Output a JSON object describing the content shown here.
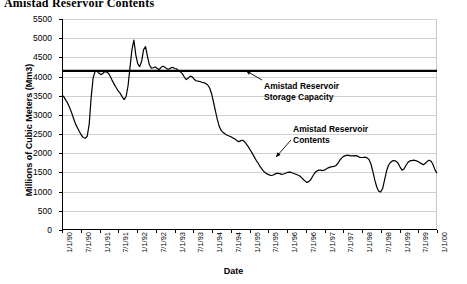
{
  "chart_data": {
    "type": "line",
    "title": "Amistad Reservoir Contents",
    "xlabel": "Date",
    "ylabel": "Millions of Cubic Meters (Mm3)",
    "ylim": [
      0,
      5500
    ],
    "ytick_step": 500,
    "yticks": [
      0,
      500,
      1000,
      1500,
      2000,
      2500,
      3000,
      3500,
      4000,
      4500,
      5000,
      5500
    ],
    "grid": true,
    "legend": "none",
    "xtick_labels": [
      "1/1/90",
      "7/1/90",
      "1/1/91",
      "7/1/91",
      "1/1/92",
      "7/1/92",
      "1/1/93",
      "7/1/93",
      "1/1/94",
      "7/1/94",
      "1/1/95",
      "7/1/95",
      "1/1/96",
      "7/1/96",
      "1/1/97",
      "7/1/97",
      "1/1/98",
      "7/1/98",
      "1/1/99",
      "7/1/99",
      "1/1/00"
    ],
    "x_start": "1/1/90",
    "x_end": "1/1/00",
    "x_tick_interval_months": 6,
    "annotations": [
      {
        "name": "capacity-annotation",
        "text_line1": "Amistad Reservoir",
        "text_line2": "Storage Capacity",
        "points_to_value": 4150
      },
      {
        "name": "contents-annotation",
        "text_line1": "Amistad Reservoir",
        "text_line2": "Contents",
        "points_to_value": 1500
      }
    ],
    "series": [
      {
        "name": "Amistad Reservoir Storage Capacity",
        "color": "#000000",
        "width": 2.2,
        "constant_value": 4150,
        "values": [
          4150,
          4150
        ]
      },
      {
        "name": "Amistad Reservoir Contents",
        "color": "#000000",
        "width": 1.2,
        "values": [
          3520,
          3470,
          3380,
          3300,
          3180,
          3050,
          2900,
          2760,
          2660,
          2560,
          2470,
          2410,
          2390,
          2450,
          2760,
          3450,
          3960,
          4130,
          4140,
          4090,
          4050,
          4080,
          4130,
          4120,
          4080,
          3990,
          3880,
          3790,
          3700,
          3620,
          3560,
          3470,
          3400,
          3480,
          3760,
          4240,
          4700,
          4950,
          4560,
          4330,
          4260,
          4400,
          4700,
          4780,
          4520,
          4300,
          4220,
          4230,
          4250,
          4210,
          4180,
          4240,
          4270,
          4240,
          4200,
          4190,
          4230,
          4240,
          4210,
          4200,
          4160,
          4120,
          4070,
          3980,
          3920,
          3960,
          4010,
          3990,
          3930,
          3890,
          3880,
          3870,
          3850,
          3840,
          3820,
          3780,
          3700,
          3550,
          3330,
          3090,
          2870,
          2690,
          2590,
          2540,
          2500,
          2470,
          2450,
          2430,
          2400,
          2370,
          2330,
          2300,
          2330,
          2340,
          2300,
          2230,
          2160,
          2080,
          1990,
          1900,
          1810,
          1740,
          1650,
          1580,
          1520,
          1480,
          1450,
          1430,
          1420,
          1440,
          1470,
          1480,
          1470,
          1450,
          1460,
          1480,
          1500,
          1510,
          1500,
          1480,
          1460,
          1440,
          1420,
          1380,
          1330,
          1280,
          1240,
          1260,
          1310,
          1400,
          1480,
          1530,
          1560,
          1560,
          1550,
          1560,
          1590,
          1620,
          1640,
          1650,
          1660,
          1680,
          1740,
          1820,
          1880,
          1920,
          1940,
          1950,
          1940,
          1930,
          1930,
          1940,
          1930,
          1900,
          1890,
          1890,
          1900,
          1880,
          1840,
          1720,
          1520,
          1300,
          1120,
          1010,
          990,
          1080,
          1300,
          1530,
          1680,
          1760,
          1800,
          1810,
          1790,
          1740,
          1640,
          1560,
          1590,
          1680,
          1760,
          1800,
          1810,
          1820,
          1810,
          1790,
          1760,
          1730,
          1700,
          1740,
          1790,
          1820,
          1790,
          1700,
          1560,
          1480
        ]
      }
    ]
  }
}
